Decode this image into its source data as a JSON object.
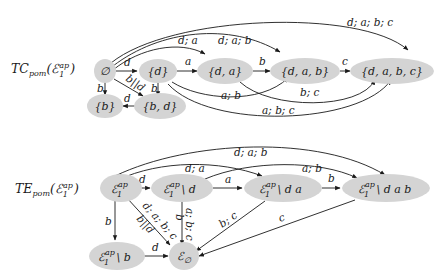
{
  "graphs": [
    {
      "title": "TC",
      "title_sub": "pom",
      "title_arg": "(ℰ",
      "title_arg_sup": "ap",
      "title_arg_sub": "1",
      "title_close": ")",
      "nodes": [
        {
          "id": "empty",
          "label": "∅"
        },
        {
          "id": "d",
          "label": "{d}"
        },
        {
          "id": "da",
          "label": "{d, a}"
        },
        {
          "id": "dab",
          "label": "{d, a, b}"
        },
        {
          "id": "dabc",
          "label": "{d, a, b, c}"
        },
        {
          "id": "b",
          "label": "{b}"
        },
        {
          "id": "bd",
          "label": "{b, d}"
        }
      ],
      "edges": [
        {
          "from": "empty",
          "to": "d",
          "label": "d"
        },
        {
          "from": "d",
          "to": "da",
          "label": "a"
        },
        {
          "from": "da",
          "to": "dab",
          "label": "b"
        },
        {
          "from": "dab",
          "to": "dabc",
          "label": "c"
        },
        {
          "from": "empty",
          "to": "b",
          "label": "b"
        },
        {
          "from": "empty",
          "to": "bd",
          "label": "b||d"
        },
        {
          "from": "d",
          "to": "bd",
          "label": "b"
        },
        {
          "from": "bd",
          "to": "b",
          "label": "d"
        },
        {
          "from": "empty",
          "to": "da",
          "label": "d; a"
        },
        {
          "from": "empty",
          "to": "dab",
          "label": "d; a; b"
        },
        {
          "from": "empty",
          "to": "dabc",
          "label": "d; a; b; c"
        },
        {
          "from": "d",
          "to": "dab",
          "label": "a; b"
        },
        {
          "from": "da",
          "to": "dabc",
          "label": "b; c"
        },
        {
          "from": "d",
          "to": "dabc",
          "label": "a; b; c"
        }
      ]
    },
    {
      "title": "TE",
      "title_sub": "pom",
      "title_arg": "(ℰ",
      "title_arg_sup": "ap",
      "title_arg_sub": "1",
      "title_close": ")",
      "nodes": [
        {
          "id": "E",
          "label": "ℰ",
          "sup": "ap",
          "sub": "1",
          "suffix": ""
        },
        {
          "id": "Ed",
          "label": "ℰ",
          "sup": "ap",
          "sub": "1",
          "suffix": " \\ d"
        },
        {
          "id": "Eda",
          "label": "ℰ",
          "sup": "ap",
          "sub": "1",
          "suffix": " \\ d a"
        },
        {
          "id": "Edab",
          "label": "ℰ",
          "sup": "ap",
          "sub": "1",
          "suffix": " \\ d a b"
        },
        {
          "id": "Eb",
          "label": "ℰ",
          "sup": "ap",
          "sub": "1",
          "suffix": " \\ b"
        },
        {
          "id": "Eempty",
          "label": "ℰ",
          "sup": "",
          "sub": "∅",
          "suffix": ""
        }
      ],
      "edges": [
        {
          "from": "E",
          "to": "Ed",
          "label": "d"
        },
        {
          "from": "Ed",
          "to": "Eda",
          "label": "a"
        },
        {
          "from": "Eda",
          "to": "Edab",
          "label": "b"
        },
        {
          "from": "E",
          "to": "Eb",
          "label": "b"
        },
        {
          "from": "Eb",
          "to": "Eempty",
          "label": "d"
        },
        {
          "from": "E",
          "to": "Eempty",
          "label": "d; a; b; c"
        },
        {
          "from": "E",
          "to": "Eempty",
          "label": "b||d"
        },
        {
          "from": "Ed",
          "to": "Eempty",
          "label": "b"
        },
        {
          "from": "Ed",
          "to": "Eempty",
          "label": "a; b; c"
        },
        {
          "from": "Eda",
          "to": "Eempty",
          "label": "b; c"
        },
        {
          "from": "Edab",
          "to": "Eempty",
          "label": "c"
        },
        {
          "from": "E",
          "to": "Eda",
          "label": "d; a"
        },
        {
          "from": "E",
          "to": "Edab",
          "label": "d; a; b"
        },
        {
          "from": "Ed",
          "to": "Edab",
          "label": "a; b"
        }
      ]
    }
  ]
}
